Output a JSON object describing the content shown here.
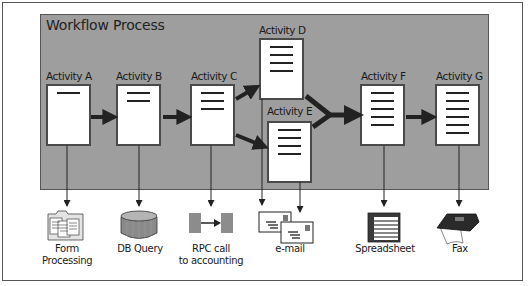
{
  "diagram": {
    "title": "Workflow Process",
    "activities": [
      {
        "id": "A",
        "label": "Activity A",
        "lines": 1
      },
      {
        "id": "B",
        "label": "Activity B",
        "lines": 2
      },
      {
        "id": "C",
        "label": "Activity C",
        "lines": 3
      },
      {
        "id": "D",
        "label": "Activity D",
        "lines": 4
      },
      {
        "id": "E",
        "label": "Activity E",
        "lines": 4
      },
      {
        "id": "F",
        "label": "Activity F",
        "lines": 5
      },
      {
        "id": "G",
        "label": "Activity G",
        "lines": 6
      }
    ],
    "flows": [
      {
        "from": "A",
        "to": "B"
      },
      {
        "from": "B",
        "to": "C"
      },
      {
        "from": "C",
        "to": "D"
      },
      {
        "from": "C",
        "to": "E"
      },
      {
        "from": "D",
        "to": "F"
      },
      {
        "from": "E",
        "to": "F"
      },
      {
        "from": "F",
        "to": "G"
      }
    ],
    "outputs": [
      {
        "from": "A",
        "icon": "form-folder-icon",
        "line1": "Form",
        "line2": "Processing"
      },
      {
        "from": "B",
        "icon": "database-icon",
        "line1": "DB Query",
        "line2": ""
      },
      {
        "from": "C",
        "icon": "rpc-icon",
        "line1": "RPC call",
        "line2": "to accounting"
      },
      {
        "from": "D,E",
        "icon": "email-icon",
        "line1": "e-mail",
        "line2": ""
      },
      {
        "from": "F",
        "icon": "spreadsheet-icon",
        "line1": "Spreadsheet",
        "line2": ""
      },
      {
        "from": "G",
        "icon": "fax-icon",
        "line1": "Fax",
        "line2": ""
      }
    ],
    "colors": {
      "panel": "#9e9e9e",
      "arrow": "#222222",
      "doc_border": "#4a4a4a"
    }
  }
}
